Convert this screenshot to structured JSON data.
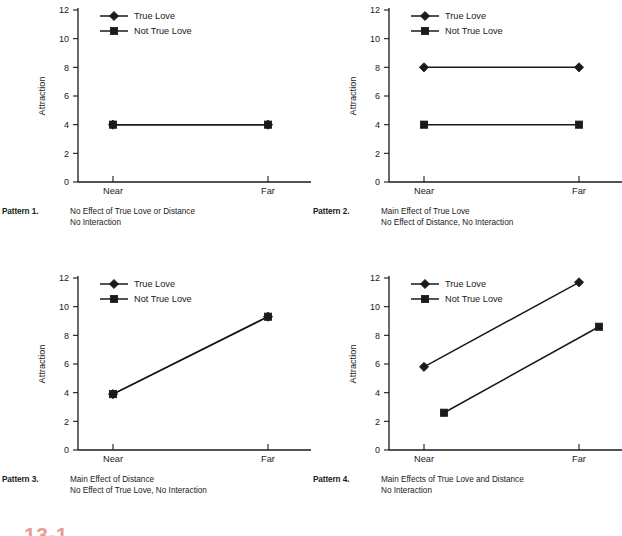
{
  "figure": {
    "number_partial": "13-1",
    "background_color": "#ffffff",
    "ink_color": "#1a1a1a",
    "fignum_color": "#d94b3a"
  },
  "axis": {
    "ylabel": "Attraction",
    "xlabel": "Distance",
    "yticks": [
      "12",
      "10",
      "8",
      "6",
      "4",
      "2",
      "0"
    ],
    "ytick_values": [
      12,
      10,
      8,
      6,
      4,
      2,
      0
    ],
    "ylim": [
      0,
      12
    ],
    "xticks": [
      "Near",
      "Far"
    ]
  },
  "legend": {
    "entries": [
      {
        "label": "True Love",
        "marker": "diamond-marker"
      },
      {
        "label": "Not True Love",
        "marker": "square-marker"
      }
    ]
  },
  "panels": [
    {
      "id": "pattern-1",
      "caption_label": "Pattern 1.",
      "caption_lines": [
        "No Effect of True Love or Distance",
        "No Interaction"
      ]
    },
    {
      "id": "pattern-2",
      "caption_label": "Pattern 2.",
      "caption_lines": [
        "Main Effect of True Love",
        "No Effect of Distance, No Interaction"
      ]
    },
    {
      "id": "pattern-3",
      "caption_label": "Pattern 3.",
      "caption_lines": [
        "Main Effect of Distance",
        "No Effect of True Love, No Interaction"
      ]
    },
    {
      "id": "pattern-4",
      "caption_label": "Pattern 4.",
      "caption_lines": [
        "Main Effects of True Love and Distance",
        "No Interaction"
      ]
    }
  ],
  "chart_data": [
    {
      "type": "line",
      "title": "Pattern 1. No Effect of True Love or Distance, No Interaction",
      "xlabel": "Distance",
      "ylabel": "Attraction",
      "categories": [
        "Near",
        "Far"
      ],
      "ylim": [
        0,
        12
      ],
      "yticks": [
        0,
        2,
        4,
        6,
        8,
        10,
        12
      ],
      "grid": false,
      "legend_position": "inside-top-left",
      "series": [
        {
          "name": "True Love",
          "marker": "diamond",
          "x_offset": 0,
          "values": [
            4.0,
            4.0
          ]
        },
        {
          "name": "Not True Love",
          "marker": "square",
          "x_offset": 0,
          "values": [
            4.0,
            4.0
          ]
        }
      ]
    },
    {
      "type": "line",
      "title": "Pattern 2. Main Effect of True Love, No Effect of Distance, No Interaction",
      "xlabel": "Distance",
      "ylabel": "Attraction",
      "categories": [
        "Near",
        "Far"
      ],
      "ylim": [
        0,
        12
      ],
      "yticks": [
        0,
        2,
        4,
        6,
        8,
        10,
        12
      ],
      "grid": false,
      "legend_position": "inside-top-left",
      "series": [
        {
          "name": "True Love",
          "marker": "diamond",
          "x_offset": 0,
          "values": [
            8.0,
            8.0
          ]
        },
        {
          "name": "Not True Love",
          "marker": "square",
          "x_offset": 0,
          "values": [
            4.0,
            4.0
          ]
        }
      ]
    },
    {
      "type": "line",
      "title": "Pattern 3. Main Effect of Distance, No Effect of True Love, No Interaction",
      "xlabel": "Distance",
      "ylabel": "Attraction",
      "categories": [
        "Near",
        "Far"
      ],
      "ylim": [
        0,
        12
      ],
      "yticks": [
        0,
        2,
        4,
        6,
        8,
        10,
        12
      ],
      "grid": false,
      "legend_position": "inside-top-left",
      "series": [
        {
          "name": "True Love",
          "marker": "diamond",
          "x_offset": 0,
          "values": [
            3.9,
            9.3
          ]
        },
        {
          "name": "Not True Love",
          "marker": "square",
          "x_offset": 0,
          "values": [
            3.9,
            9.3
          ]
        }
      ]
    },
    {
      "type": "line",
      "title": "Pattern 4. Main Effects of True Love and Distance, No Interaction",
      "xlabel": "Distance",
      "ylabel": "Attraction",
      "categories": [
        "Near",
        "Far"
      ],
      "ylim": [
        0,
        12
      ],
      "yticks": [
        0,
        2,
        4,
        6,
        8,
        10,
        12
      ],
      "grid": false,
      "legend_position": "inside-top-left",
      "series": [
        {
          "name": "True Love",
          "marker": "diamond",
          "x_offset": 0,
          "values": [
            5.8,
            11.7
          ]
        },
        {
          "name": "Not True Love",
          "marker": "square",
          "x_offset": 20,
          "values": [
            2.6,
            8.6
          ]
        }
      ]
    }
  ]
}
